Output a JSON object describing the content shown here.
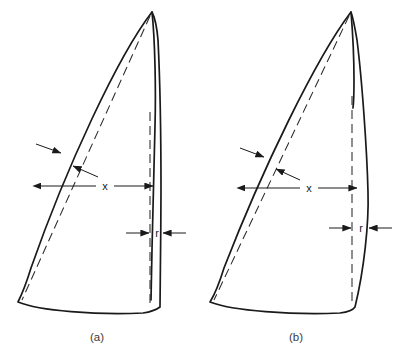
{
  "figure": {
    "background_color": "#ffffff",
    "line_color": "#1a1a1a",
    "dash_color": "#2b2b2b",
    "panels": [
      {
        "id": "panel-a",
        "caption": "(a)",
        "dimension_x_label": "x",
        "dimension_r_label": "r"
      },
      {
        "id": "panel-b",
        "caption": "(b)",
        "dimension_x_label": "x",
        "dimension_r_label": "r"
      }
    ]
  }
}
